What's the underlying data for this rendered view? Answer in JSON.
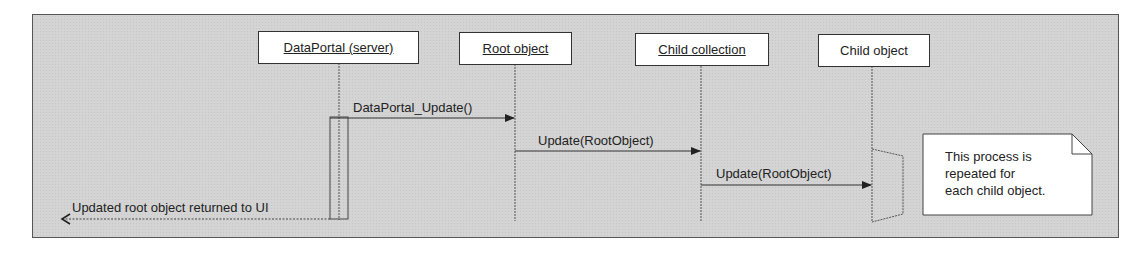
{
  "diagram": {
    "type": "sequence",
    "participants": [
      {
        "id": "dataportal",
        "label": "DataPortal (server)",
        "underlined": true
      },
      {
        "id": "root",
        "label": "Root object",
        "underlined": true
      },
      {
        "id": "childcoll",
        "label": "Child collection",
        "underlined": true
      },
      {
        "id": "childobj",
        "label": "Child object",
        "underlined": false
      }
    ],
    "messages": [
      {
        "from": "dataportal",
        "to": "root",
        "label": "DataPortal_Update()",
        "style": "solid"
      },
      {
        "from": "root",
        "to": "childcoll",
        "label": "Update(RootObject)",
        "style": "solid"
      },
      {
        "from": "childcoll",
        "to": "childobj",
        "label": "Update(RootObject)",
        "style": "solid"
      },
      {
        "from": "dataportal",
        "to": "UI",
        "label": "Updated root object returned to UI",
        "style": "dashed"
      }
    ],
    "note": {
      "lines": [
        "This process is",
        "repeated for",
        "each child object."
      ]
    },
    "colors": {
      "background": "#d4d4d4",
      "box_fill": "#ffffff",
      "line": "#333333"
    }
  }
}
